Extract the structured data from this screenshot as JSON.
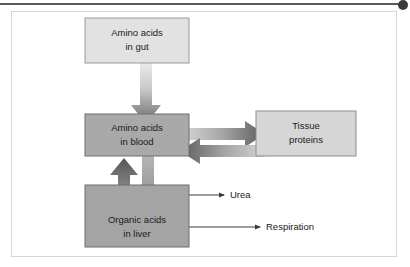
{
  "figure": {
    "header_rule_color": "#595959",
    "header_dot_color": "#3b3b3b",
    "panel_border_color": "#d6d6d6",
    "background": "#ffffff"
  },
  "nodes": [
    {
      "id": "amino-acids-gut",
      "line1": "Amino acids",
      "line2": "in gut",
      "fill": "#e2e2e2",
      "stroke": "#9a9a9a",
      "x": 84,
      "y": 17,
      "w": 104,
      "h": 45
    },
    {
      "id": "amino-acids-blood",
      "line1": "Amino acids",
      "line2": "in blood",
      "fill": "#a9a9a9",
      "stroke": "#6f6f6f",
      "x": 84,
      "y": 113,
      "w": 104,
      "h": 42
    },
    {
      "id": "tissue-proteins",
      "line1": "Tissue",
      "line2": "proteins",
      "fill": "#d6d6d6",
      "stroke": "#8d8d8d",
      "x": 255,
      "y": 110,
      "w": 100,
      "h": 45
    },
    {
      "id": "organic-acids-liver",
      "line1": "Organic acids",
      "line2": "in liver",
      "fill": "#a4a4a4",
      "stroke": "#6f6f6f",
      "x": 84,
      "y": 184,
      "w": 104,
      "h": 62
    }
  ],
  "arrows": [
    {
      "id": "gut-to-blood",
      "from": "amino-acids-gut",
      "to": "amino-acids-blood",
      "direction": "down",
      "style": "gradient-block",
      "light": "#e6e6e6",
      "dark": "#6b6b6b"
    },
    {
      "id": "blood-to-tissue",
      "from": "amino-acids-blood",
      "to": "tissue-proteins",
      "direction": "right",
      "style": "gradient-block",
      "light": "#dcdcdc",
      "dark": "#5e5e5e"
    },
    {
      "id": "tissue-to-blood",
      "from": "tissue-proteins",
      "to": "amino-acids-blood",
      "direction": "left",
      "style": "gradient-block",
      "light": "#d2d2d2",
      "dark": "#5e5e5e"
    },
    {
      "id": "blood-to-liver",
      "from": "amino-acids-blood",
      "to": "organic-acids-liver",
      "direction": "down",
      "style": "gradient-block",
      "light": "#b4b4b4",
      "dark": "#707070"
    },
    {
      "id": "liver-to-blood",
      "from": "organic-acids-liver",
      "to": "amino-acids-blood",
      "direction": "up",
      "style": "gradient-block",
      "light": "#9e9e9e",
      "dark": "#5a5a5a"
    }
  ],
  "outputs": [
    {
      "id": "urea",
      "label": "Urea",
      "source": "organic-acids-liver",
      "line_y": 194,
      "line_x1": 188,
      "line_x2": 222,
      "label_x": 232,
      "stroke": "#3a3a3a"
    },
    {
      "id": "respiration",
      "label": "Respiration",
      "source": "organic-acids-liver",
      "line_y": 225,
      "line_x1": 188,
      "line_x2": 258,
      "label_x": 268,
      "stroke": "#3a3a3a"
    }
  ]
}
